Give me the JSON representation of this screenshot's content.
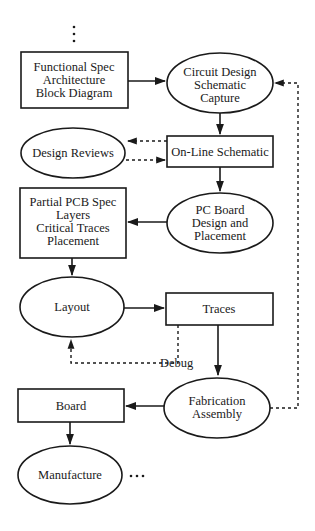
{
  "diagram": {
    "type": "flowchart",
    "nodes": [
      {
        "id": "functional_spec",
        "shape": "rect",
        "lines": [
          "Functional Spec",
          "Architecture",
          "Block Diagram"
        ]
      },
      {
        "id": "circuit_design",
        "shape": "ellipse",
        "lines": [
          "Circuit Design",
          "Schematic",
          "Capture"
        ]
      },
      {
        "id": "design_reviews",
        "shape": "ellipse",
        "lines": [
          "Design Reviews"
        ]
      },
      {
        "id": "online_schematic",
        "shape": "rect",
        "lines": [
          "On-Line Schematic"
        ]
      },
      {
        "id": "partial_pcb_spec",
        "shape": "rect",
        "lines": [
          "Partial PCB Spec",
          "Layers",
          "Critical Traces",
          "Placement"
        ]
      },
      {
        "id": "pc_board_design",
        "shape": "ellipse",
        "lines": [
          "PC Board",
          "Design and",
          "Placement"
        ]
      },
      {
        "id": "layout",
        "shape": "ellipse",
        "lines": [
          "Layout"
        ]
      },
      {
        "id": "traces",
        "shape": "rect",
        "lines": [
          "Traces"
        ]
      },
      {
        "id": "fabrication",
        "shape": "ellipse",
        "lines": [
          "Fabrication",
          "Assembly"
        ]
      },
      {
        "id": "board",
        "shape": "rect",
        "lines": [
          "Board"
        ]
      },
      {
        "id": "manufacture",
        "shape": "ellipse",
        "lines": [
          "Manufacture"
        ]
      }
    ],
    "edges": [
      {
        "from": "top_ellipsis",
        "to": "functional_spec",
        "style": "dotted",
        "label": ""
      },
      {
        "from": "functional_spec",
        "to": "circuit_design",
        "style": "solid",
        "label": ""
      },
      {
        "from": "circuit_design",
        "to": "online_schematic",
        "style": "solid",
        "label": ""
      },
      {
        "from": "online_schematic",
        "to": "design_reviews",
        "style": "dashed",
        "label": ""
      },
      {
        "from": "design_reviews",
        "to": "online_schematic",
        "style": "dashed",
        "label": ""
      },
      {
        "from": "online_schematic",
        "to": "pc_board_design",
        "style": "solid",
        "label": ""
      },
      {
        "from": "pc_board_design",
        "to": "partial_pcb_spec",
        "style": "solid",
        "label": ""
      },
      {
        "from": "partial_pcb_spec",
        "to": "layout",
        "style": "solid",
        "label": ""
      },
      {
        "from": "layout",
        "to": "traces",
        "style": "solid",
        "label": ""
      },
      {
        "from": "traces",
        "to": "layout",
        "style": "dashed",
        "label": "Debug"
      },
      {
        "from": "traces",
        "to": "fabrication",
        "style": "solid",
        "label": ""
      },
      {
        "from": "fabrication",
        "to": "circuit_design",
        "style": "dashed",
        "label": ""
      },
      {
        "from": "fabrication",
        "to": "board",
        "style": "solid",
        "label": ""
      },
      {
        "from": "board",
        "to": "manufacture",
        "style": "solid",
        "label": ""
      }
    ],
    "labels": {
      "debug": "Debug",
      "top_ellipsis": "⋮",
      "end_ellipsis": "…"
    },
    "colors": {
      "stroke": "#1a1a1a",
      "background": "#ffffff"
    }
  }
}
